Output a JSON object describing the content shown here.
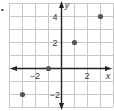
{
  "marker": "•",
  "chart_data": {
    "type": "scatter",
    "title": "",
    "xlabel": "x",
    "ylabel": "y",
    "xlim": [
      -4,
      4
    ],
    "ylim": [
      -3,
      5
    ],
    "grid": true,
    "x_ticks_labeled": [
      {
        "value": -2,
        "label": "−2"
      },
      {
        "value": 2,
        "label": "2"
      }
    ],
    "y_ticks_labeled": [
      {
        "value": 4,
        "label": "4"
      },
      {
        "value": 2,
        "label": "2"
      },
      {
        "value": -2,
        "label": "−2"
      }
    ],
    "points": [
      {
        "x": -3,
        "y": -2
      },
      {
        "x": -1,
        "y": 0
      },
      {
        "x": 1,
        "y": 2
      },
      {
        "x": 3,
        "y": 4
      }
    ]
  },
  "colors": {
    "grid": "#c8c8c8",
    "axis": "#222222",
    "point": "#555555",
    "text": "#333333"
  }
}
